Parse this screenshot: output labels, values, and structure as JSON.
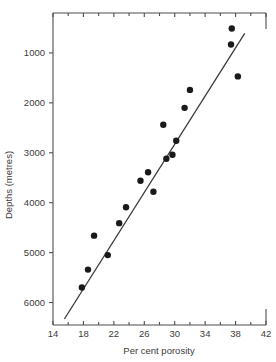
{
  "chart_data": {
    "type": "scatter",
    "title": "",
    "xlabel": "Per cent porosity",
    "ylabel": "Depths (metres)",
    "xlim": [
      14,
      42
    ],
    "ylim": [
      6450,
      200
    ],
    "y_inverted": true,
    "grid": false,
    "legend": null,
    "xticks": [
      14,
      18,
      22,
      26,
      30,
      34,
      38,
      42
    ],
    "xticklabels": [
      "14",
      "18",
      "22",
      "26",
      "30",
      "34",
      "38",
      "42"
    ],
    "x_minor_ticks": [
      16,
      20,
      24,
      28,
      32,
      36,
      40
    ],
    "yticks": [
      1000,
      2000,
      3000,
      4000,
      5000,
      6000
    ],
    "yticklabels": [
      "1000",
      "2000",
      "3000",
      "4000",
      "5000",
      "6000"
    ],
    "x": [
      17.8,
      18.6,
      19.4,
      21.2,
      22.7,
      23.6,
      25.5,
      27.2,
      28.5,
      28.9,
      29.7,
      30.2,
      31.3,
      32.0,
      37.4,
      37.5,
      38.3,
      26.5
    ],
    "y": [
      5700,
      5340,
      4660,
      5050,
      4410,
      4090,
      3560,
      3780,
      2440,
      3120,
      3040,
      2760,
      2100,
      1740,
      830,
      510,
      1470,
      3390
    ],
    "points": [
      {
        "x": 17.8,
        "y": 5700
      },
      {
        "x": 18.6,
        "y": 5340
      },
      {
        "x": 19.4,
        "y": 4660
      },
      {
        "x": 21.2,
        "y": 5050
      },
      {
        "x": 22.7,
        "y": 4410
      },
      {
        "x": 23.6,
        "y": 4090
      },
      {
        "x": 25.5,
        "y": 3560
      },
      {
        "x": 26.5,
        "y": 3390
      },
      {
        "x": 27.2,
        "y": 3780
      },
      {
        "x": 28.5,
        "y": 2440
      },
      {
        "x": 28.9,
        "y": 3120
      },
      {
        "x": 29.7,
        "y": 3040
      },
      {
        "x": 30.2,
        "y": 2760
      },
      {
        "x": 31.3,
        "y": 2100
      },
      {
        "x": 32.0,
        "y": 1740
      },
      {
        "x": 37.4,
        "y": 830
      },
      {
        "x": 37.5,
        "y": 510
      },
      {
        "x": 38.3,
        "y": 1470
      }
    ],
    "marker": "filled-circle",
    "marker_color": "#1a1a1a",
    "marker_size": 3.2,
    "series": [
      {
        "name": "porosity-depth observations",
        "type": "scatter",
        "values": [
          5700,
          5340,
          4660,
          5050,
          4410,
          4090,
          3560,
          3390,
          3780,
          2440,
          3120,
          3040,
          2760,
          2100,
          1740,
          830,
          510,
          1470
        ]
      },
      {
        "name": "fitted regression line",
        "type": "line",
        "x_endpoints": [
          15.5,
          39.2
        ],
        "y_endpoints": [
          6330,
          610
        ],
        "color": "#3a3a3a"
      }
    ]
  },
  "axes": {
    "x_title": "Per cent porosity",
    "y_title": "Depths (metres)"
  }
}
